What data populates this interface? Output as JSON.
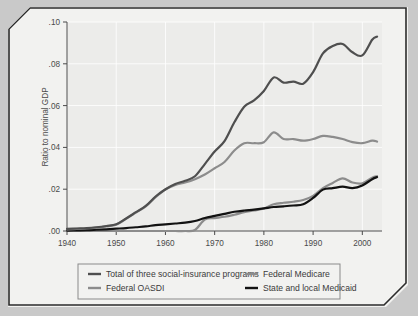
{
  "page": {
    "background_color": "#c9c9c9",
    "sheet_color": "#f2f2f0",
    "border_color": "#2b2b2b"
  },
  "chart_data": {
    "type": "line",
    "title": "",
    "subtitle": "",
    "xlabel": "",
    "ylabel": "Ratio to nominal GDP",
    "xlim": [
      1940,
      2004
    ],
    "ylim": [
      0.0,
      0.1
    ],
    "grid": true,
    "grid_color": "#ffffff",
    "plot_background": "#ececea",
    "legend_position": "bottom",
    "xticks": [
      1940,
      1950,
      1960,
      1970,
      1980,
      1990,
      2000
    ],
    "xtick_labels": [
      "1940",
      "1950",
      "1960",
      "1970",
      "1980",
      "1990",
      "2000"
    ],
    "yticks": [
      0.0,
      0.02,
      0.04,
      0.06,
      0.08,
      0.1
    ],
    "ytick_labels": [
      ".00",
      ".02",
      ".04",
      ".06",
      ".08",
      ".10"
    ],
    "x": [
      1940,
      1942,
      1944,
      1946,
      1948,
      1950,
      1952,
      1954,
      1956,
      1958,
      1960,
      1962,
      1964,
      1966,
      1968,
      1970,
      1972,
      1974,
      1976,
      1978,
      1980,
      1982,
      1984,
      1986,
      1988,
      1990,
      1992,
      1994,
      1996,
      1998,
      2000,
      2002,
      2003
    ],
    "series": [
      {
        "name": "Total of three social-insurance programs",
        "color": "#4f4f4f",
        "width": 2.2,
        "values": [
          0.001,
          0.0012,
          0.0014,
          0.0018,
          0.0024,
          0.0032,
          0.006,
          0.009,
          0.012,
          0.0165,
          0.02,
          0.0225,
          0.024,
          0.0262,
          0.032,
          0.038,
          0.043,
          0.052,
          0.0595,
          0.0625,
          0.067,
          0.0735,
          0.071,
          0.0715,
          0.0705,
          0.076,
          0.085,
          0.0885,
          0.0895,
          0.0855,
          0.084,
          0.0915,
          0.093
        ]
      },
      {
        "name": "Federal OASDI",
        "color": "#8c8c8c",
        "width": 2.2,
        "values": [
          0.0008,
          0.001,
          0.0012,
          0.0016,
          0.0022,
          0.003,
          0.0058,
          0.0088,
          0.0118,
          0.0162,
          0.0198,
          0.022,
          0.0232,
          0.0248,
          0.027,
          0.03,
          0.033,
          0.0385,
          0.042,
          0.042,
          0.0425,
          0.0472,
          0.044,
          0.044,
          0.0432,
          0.044,
          0.0455,
          0.045,
          0.044,
          0.0425,
          0.042,
          0.0432,
          0.0428
        ]
      },
      {
        "name": "Federal Medicare",
        "color": "#8c8c8c",
        "width": 2.2,
        "values": [
          0.0,
          0.0,
          0.0,
          0.0,
          0.0,
          0.0,
          0.0,
          0.0,
          0.0,
          0.0,
          0.0,
          0.0,
          0.0,
          0.0005,
          0.0055,
          0.0062,
          0.0068,
          0.0078,
          0.009,
          0.0098,
          0.0108,
          0.0128,
          0.0135,
          0.014,
          0.0148,
          0.0168,
          0.0205,
          0.023,
          0.0252,
          0.0232,
          0.0228,
          0.0255,
          0.0262
        ]
      },
      {
        "name": "State and local Medicaid",
        "color": "#121212",
        "width": 2.2,
        "values": [
          0.0002,
          0.0003,
          0.0004,
          0.0006,
          0.0008,
          0.0011,
          0.0014,
          0.0018,
          0.0022,
          0.0028,
          0.0032,
          0.0036,
          0.004,
          0.0048,
          0.0062,
          0.0072,
          0.0082,
          0.0092,
          0.0098,
          0.0102,
          0.0108,
          0.0115,
          0.0118,
          0.0122,
          0.0128,
          0.0158,
          0.0198,
          0.0205,
          0.0212,
          0.0205,
          0.0218,
          0.0248,
          0.0258
        ]
      }
    ],
    "legend_entries": [
      {
        "label": "Total of three social-insurance programs",
        "color": "#4f4f4f"
      },
      {
        "label": "Federal Medicare",
        "color": "#8c8c8c"
      },
      {
        "label": "Federal OASDI",
        "color": "#8c8c8c"
      },
      {
        "label": "State and local Medicaid",
        "color": "#121212"
      }
    ]
  }
}
